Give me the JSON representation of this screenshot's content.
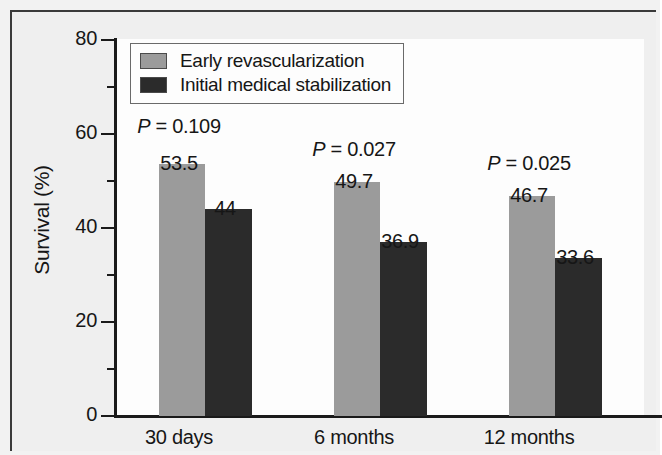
{
  "chart_data": {
    "type": "bar",
    "title": "",
    "xlabel": "",
    "ylabel": "Survival (%)",
    "categories": [
      "30 days",
      "6 months",
      "12 months"
    ],
    "series": [
      {
        "name": "Early revascularization",
        "color": "#9b9b9b",
        "values": [
          53.5,
          49.7,
          46.7
        ],
        "labels": [
          "53.5",
          "49.7",
          "46.7"
        ]
      },
      {
        "name": "Initial medical stabilization",
        "color": "#2b2b2b",
        "values": [
          44,
          36.9,
          33.6
        ],
        "labels": [
          "44",
          "36.9",
          "33.6"
        ]
      }
    ],
    "annotations": [
      {
        "prefix": "P",
        "text": " = 0.109",
        "full": "P = 0.109"
      },
      {
        "prefix": "P",
        "text": " = 0.027",
        "full": "P = 0.027"
      },
      {
        "prefix": "P",
        "text": " = 0.025",
        "full": "P = 0.025"
      }
    ],
    "ylim": [
      0,
      80
    ],
    "yticks": [
      0,
      20,
      40,
      60,
      80
    ],
    "ytick_labels": [
      "0",
      "20",
      "40",
      "60",
      "80"
    ],
    "yminor_ticks": [
      10,
      30,
      50,
      70
    ],
    "grid": false,
    "legend_position": "top-left"
  },
  "legend": {
    "entries": [
      {
        "label": "Early revascularization",
        "color": "#9b9b9b"
      },
      {
        "label": "Initial medical stabilization",
        "color": "#2b2b2b"
      }
    ]
  },
  "axis": {
    "y_title": "Survival (%)",
    "y_labels": [
      "80",
      "60",
      "40",
      "20",
      "0"
    ],
    "x_labels": [
      "30 days",
      "6 months",
      "12 months"
    ]
  }
}
